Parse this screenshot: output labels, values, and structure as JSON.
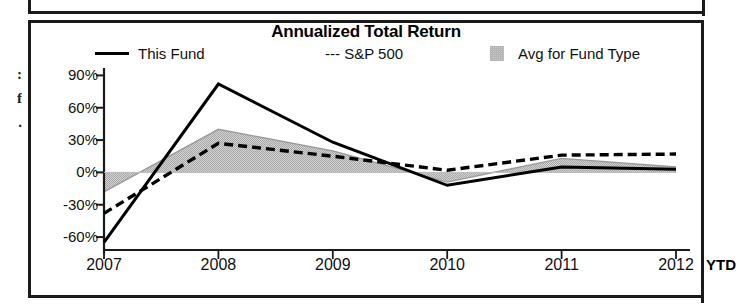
{
  "panel": {
    "margin_bleed_text": ":\nf\n."
  },
  "chart_title": "Annualized Total Return",
  "legend": {
    "items": [
      {
        "label": "This Fund",
        "marker": "solid-line-swatch"
      },
      {
        "label": "--- S&P 500",
        "marker": "dashed-line-swatch"
      },
      {
        "label": "Avg for Fund Type",
        "marker": "shaded-area-swatch"
      }
    ]
  },
  "axis": {
    "ytd_label": "YTD"
  },
  "colors": {
    "line_this_fund": "#000000",
    "line_sp500": "#000000",
    "area_avg_fill": "#c9c9c9",
    "area_avg_stroke": "#9a9a9a",
    "axis": "#1a1a1a",
    "background": "#ffffff"
  },
  "chart_data": {
    "type": "line",
    "title": "Annualized Total Return",
    "xlabel": "",
    "ylabel": "",
    "categories": [
      "2007",
      "2008",
      "2009",
      "2010",
      "2011",
      "2012"
    ],
    "x_tick_labels": [
      "2007",
      "2008",
      "2009",
      "2010",
      "2011",
      "2012"
    ],
    "x_note": "YTD",
    "y_tick_labels": [
      "90%",
      "60%",
      "30%",
      "0%",
      "-30%",
      "-60%"
    ],
    "y_tick_values": [
      90,
      60,
      30,
      0,
      -30,
      -60
    ],
    "ylim": [
      -72,
      95
    ],
    "y_unit": "percent",
    "grid": false,
    "legend_position": "top",
    "series": [
      {
        "name": "This Fund",
        "style": "solid",
        "values": [
          -65,
          82,
          28,
          -12,
          5,
          3
        ]
      },
      {
        "name": "S&P 500",
        "style": "dashed",
        "values": [
          -38,
          27,
          15,
          2,
          16,
          17
        ]
      },
      {
        "name": "Avg for Fund Type",
        "style": "area",
        "values": [
          -18,
          40,
          20,
          -9,
          13,
          5
        ]
      }
    ],
    "area_baseline": 0
  }
}
